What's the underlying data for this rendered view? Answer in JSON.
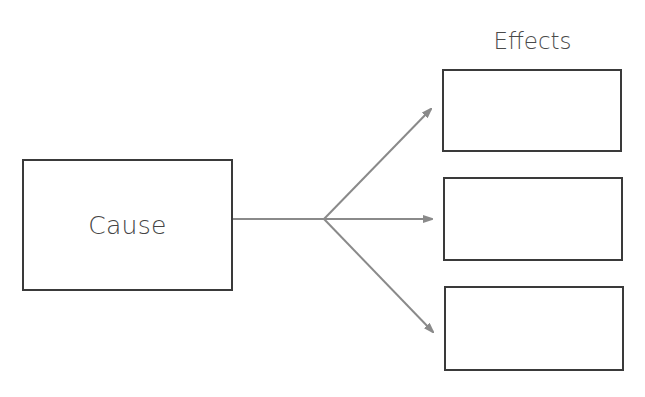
{
  "diagram": {
    "type": "cause-and-effect",
    "cause": {
      "label": "Cause"
    },
    "effects_title": "Effects",
    "effects": [
      {
        "label": ""
      },
      {
        "label": ""
      },
      {
        "label": ""
      }
    ],
    "colors": {
      "box_border": "#3a3a3a",
      "connector": "#8a8a8a",
      "text": "#444444",
      "background": "#ffffff"
    },
    "connectors": {
      "stem": {
        "from": [
          233,
          219
        ],
        "to": [
          324,
          219
        ]
      },
      "branches": [
        {
          "from": [
            324,
            219
          ],
          "to": [
            431,
            109
          ],
          "target": "effect-1"
        },
        {
          "from": [
            324,
            219
          ],
          "to": [
            432,
            219
          ],
          "target": "effect-2"
        },
        {
          "from": [
            324,
            219
          ],
          "to": [
            433,
            332
          ],
          "target": "effect-3"
        }
      ]
    }
  }
}
